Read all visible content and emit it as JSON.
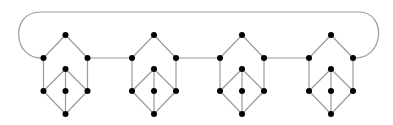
{
  "diagram": {
    "type": "graph",
    "colors": {
      "edge": "#9a9a9a",
      "node": "#000000",
      "background": "#ffffff"
    },
    "node_radius": 3,
    "gadget_template": {
      "nodes": {
        "top": [
          0,
          -23
        ],
        "left": [
          -22,
          0
        ],
        "right": [
          22,
          0
        ],
        "inner_top": [
          0,
          11
        ],
        "inner_left": [
          -22,
          33
        ],
        "inner_mid": [
          0,
          33
        ],
        "inner_right": [
          22,
          33
        ],
        "bottom": [
          0,
          56
        ]
      },
      "edges": [
        [
          "top",
          "left"
        ],
        [
          "top",
          "right"
        ],
        [
          "left",
          "inner_left"
        ],
        [
          "right",
          "inner_right"
        ],
        [
          "inner_top",
          "inner_left"
        ],
        [
          "inner_top",
          "inner_mid"
        ],
        [
          "inner_top",
          "inner_right"
        ],
        [
          "inner_left",
          "bottom"
        ],
        [
          "inner_mid",
          "bottom"
        ],
        [
          "inner_right",
          "bottom"
        ]
      ]
    },
    "gadgets": [
      {
        "id": "g1",
        "cx": 65.5,
        "cy": 58
      },
      {
        "id": "g2",
        "cx": 154,
        "cy": 58
      },
      {
        "id": "g3",
        "cx": 242,
        "cy": 58
      },
      {
        "id": "g4",
        "cx": 331,
        "cy": 58
      }
    ],
    "connectors": [
      [
        "g1.right",
        "g2.left"
      ],
      [
        "g2.right",
        "g3.left"
      ],
      [
        "g3.right",
        "g4.left"
      ]
    ],
    "loop": {
      "from": "g1.left",
      "to": "g4.right",
      "top_y": 12,
      "left_extreme_x": 16,
      "right_extreme_x": 381
    }
  }
}
